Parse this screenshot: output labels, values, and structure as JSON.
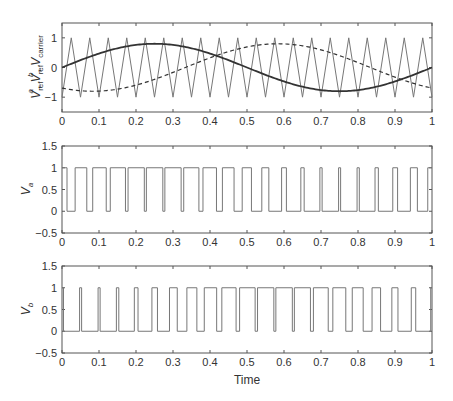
{
  "figure": {
    "xlabel": "Time"
  },
  "chart_data": [
    {
      "type": "line",
      "title": "",
      "xlabel": "",
      "ylabel": "V_ref^a, V_ref^b, V_carrier",
      "xlim": [
        0,
        1
      ],
      "ylim": [
        -1.5,
        1.5
      ],
      "xticks": [
        "0",
        "0.1",
        "0.2",
        "0.3",
        "0.4",
        "0.5",
        "0.6",
        "0.7",
        "0.8",
        "0.9",
        "1"
      ],
      "yticks": [
        "-1",
        "0",
        "1"
      ],
      "grid": false,
      "series": [
        {
          "name": "V_ref^a",
          "style": "solid-thick",
          "formula": "0.8*sin(2*pi*t)",
          "amplitude": 0.8,
          "phase_deg": 0,
          "x": [
            0,
            0.1,
            0.2,
            0.25,
            0.3,
            0.4,
            0.5,
            0.6,
            0.7,
            0.75,
            0.8,
            0.9,
            1.0
          ],
          "values": [
            0,
            0.47,
            0.76,
            0.8,
            0.76,
            0.47,
            0,
            -0.47,
            -0.76,
            -0.8,
            -0.76,
            -0.47,
            0
          ]
        },
        {
          "name": "V_ref^b",
          "style": "dashed",
          "formula": "0.8*sin(2*pi*t - 2*pi/3)",
          "amplitude": 0.8,
          "phase_deg": -120,
          "x": [
            0,
            0.083,
            0.1,
            0.2,
            0.3,
            0.4,
            0.5,
            0.583,
            0.6,
            0.7,
            0.8,
            0.9,
            1.0
          ],
          "values": [
            -0.69,
            -0.8,
            -0.8,
            -0.56,
            -0.13,
            0.35,
            0.69,
            0.8,
            0.8,
            0.56,
            0.13,
            -0.35,
            -0.69
          ]
        },
        {
          "name": "V_carrier",
          "style": "thin-gray",
          "type": "triangle",
          "period": 0.05,
          "min": -1,
          "max": 1,
          "peaks_at": "0.025 + 0.05k",
          "troughs_at": "0.05k"
        }
      ]
    },
    {
      "type": "line",
      "xlabel": "",
      "ylabel": "V_a",
      "xlim": [
        0,
        1
      ],
      "ylim": [
        -0.5,
        1.5
      ],
      "xticks": [
        "0",
        "0.1",
        "0.2",
        "0.3",
        "0.4",
        "0.5",
        "0.6",
        "0.7",
        "0.8",
        "0.9",
        "1"
      ],
      "yticks": [
        "-0.5",
        "0",
        "0.5",
        "1",
        "1.5"
      ],
      "grid": false,
      "series": [
        {
          "name": "V_a",
          "type": "pwm",
          "rule": "1 if V_ref^a > V_carrier else 0",
          "levels": [
            0,
            1
          ]
        }
      ]
    },
    {
      "type": "line",
      "xlabel": "Time",
      "ylabel": "V_b",
      "xlim": [
        0,
        1
      ],
      "ylim": [
        -0.5,
        1.5
      ],
      "xticks": [
        "0",
        "0.1",
        "0.2",
        "0.3",
        "0.4",
        "0.5",
        "0.6",
        "0.7",
        "0.8",
        "0.9",
        "1"
      ],
      "yticks": [
        "-0.5",
        "0",
        "0.5",
        "1",
        "1.5"
      ],
      "grid": false,
      "series": [
        {
          "name": "V_b",
          "type": "pwm",
          "rule": "1 if V_ref^b > V_carrier else 0",
          "levels": [
            0,
            1
          ]
        }
      ]
    }
  ],
  "colors": {
    "frame": "#555555",
    "ref_a": "#333333",
    "ref_b": "#333333",
    "carrier": "#777777",
    "pwm": "#777777"
  }
}
